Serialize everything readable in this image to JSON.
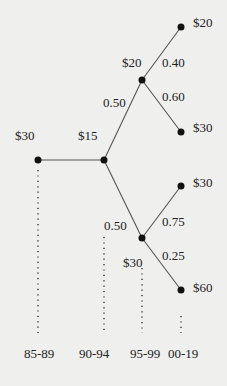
{
  "diagram": {
    "type": "probability-tree",
    "nodes": [
      {
        "id": "n0",
        "value_label": "$30"
      },
      {
        "id": "n1",
        "value_label": "$15"
      },
      {
        "id": "n2",
        "value_label": "$20"
      },
      {
        "id": "n3",
        "value_label": "$20"
      },
      {
        "id": "n4",
        "value_label": "$30"
      },
      {
        "id": "n5",
        "value_label": "$30"
      },
      {
        "id": "n6",
        "value_label": "$30"
      },
      {
        "id": "n7",
        "value_label": "$60"
      }
    ],
    "edges": [
      {
        "from": "n0",
        "to": "n1",
        "prob": ""
      },
      {
        "from": "n1",
        "to": "n2",
        "prob": "0.50"
      },
      {
        "from": "n1",
        "to": "n5",
        "prob": "0.50"
      },
      {
        "from": "n2",
        "to": "n3",
        "prob": "0.40"
      },
      {
        "from": "n2",
        "to": "n4",
        "prob": "0.60"
      },
      {
        "from": "n5",
        "to": "n6",
        "prob": "0.75"
      },
      {
        "from": "n5",
        "to": "n7",
        "prob": "0.25"
      }
    ],
    "periods": [
      "85-89",
      "90-94",
      "95-99",
      "00-19"
    ]
  }
}
